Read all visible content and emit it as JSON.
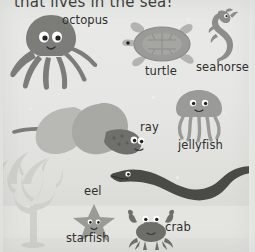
{
  "page": {
    "heading": "that lives in the sea!",
    "palette": {
      "water_top": "#e9eae7",
      "water_bottom": "#d9dad6",
      "sand": "#e4e4e0",
      "ink": "#2f2f2d",
      "octopus": "#7c7c79",
      "turtle_shell": "#9a9b96",
      "turtle_body": "#b3b4af",
      "seahorse": "#8d8e89",
      "jellyfish": "#9a9b96",
      "ray_top": "#b8b9b4",
      "ray_body": "#a8a9a4",
      "ray_head": "#6f706c",
      "eel": "#4a4a47",
      "starfish": "#9a9b96",
      "crab": "#6e6f6b",
      "coral": "#cfd0cb"
    }
  },
  "creatures": [
    {
      "id": "octopus",
      "label": "octopus",
      "label_x": 62,
      "label_y": 15
    },
    {
      "id": "turtle",
      "label": "turtle",
      "label_x": 145,
      "label_y": 66
    },
    {
      "id": "seahorse",
      "label": "seahorse",
      "label_x": 196,
      "label_y": 62
    },
    {
      "id": "ray",
      "label": "ray",
      "label_x": 140,
      "label_y": 122
    },
    {
      "id": "jellyfish",
      "label": "jellyfish",
      "label_x": 178,
      "label_y": 140
    },
    {
      "id": "eel",
      "label": "eel",
      "label_x": 84,
      "label_y": 186
    },
    {
      "id": "starfish",
      "label": "starfish",
      "label_x": 66,
      "label_y": 233
    },
    {
      "id": "crab",
      "label": "crab",
      "label_x": 165,
      "label_y": 222
    }
  ],
  "scene": {
    "coral_name": "coral",
    "seaweed_name": "seaweed",
    "bubbles": 9
  }
}
